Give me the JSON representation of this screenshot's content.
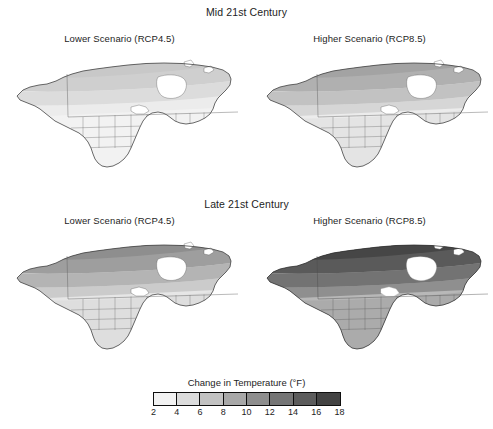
{
  "figure": {
    "sections": [
      {
        "heading": "Mid 21st Century",
        "panels": [
          {
            "title": "Lower Scenario (RCP4.5)",
            "scenario": "RCP4.5",
            "period": "Mid 21st Century"
          },
          {
            "title": "Higher Scenario (RCP8.5)",
            "scenario": "RCP8.5",
            "period": "Mid 21st Century"
          }
        ]
      },
      {
        "heading": "Late 21st Century",
        "panels": [
          {
            "title": "Lower Scenario (RCP4.5)",
            "scenario": "RCP4.5",
            "period": "Late 21st Century"
          },
          {
            "title": "Higher Scenario (RCP8.5)",
            "scenario": "RCP8.5",
            "period": "Late 21st Century"
          }
        ]
      }
    ],
    "legend": {
      "title": "Change in Temperature (°F)",
      "tick_labels": [
        "2",
        "4",
        "6",
        "8",
        "10",
        "12",
        "14",
        "16",
        "18"
      ],
      "swatches": [
        "#f2f2f2",
        "#dcdcdc",
        "#c2c2c2",
        "#a8a8a8",
        "#8e8e8e",
        "#757575",
        "#5c5c5c",
        "#434343"
      ]
    }
  },
  "chart_data": {
    "type": "heatmap",
    "subtitle": "Four-panel map matrix: two time periods × two emissions scenarios",
    "variable": "Change in Temperature",
    "units": "°F",
    "region": "North America (continental, including Alaska, Canada, Mexico, Greenland margin)",
    "colormap": "grayscale, light = small change, dark = large change",
    "legend_position": "bottom center",
    "grid": false,
    "colorbar": {
      "tick_values": [
        2,
        4,
        6,
        8,
        10,
        12,
        14,
        16,
        18
      ],
      "bin_edges": [
        2,
        4,
        6,
        8,
        10,
        12,
        14,
        16,
        18
      ],
      "bin_count": 8,
      "bin_colors": [
        "#f2f2f2",
        "#dcdcdc",
        "#c2c2c2",
        "#a8a8a8",
        "#8e8e8e",
        "#757575",
        "#5c5c5c",
        "#434343"
      ],
      "vmin": 2,
      "vmax": 18
    },
    "panels": [
      {
        "period": "Mid 21st Century",
        "scenario": "RCP4.5",
        "row": 0,
        "col": 0,
        "range_degF": [
          2,
          8
        ],
        "bands": [
          {
            "zone": "Mexico / southern US",
            "value_degF": 3,
            "bin": "2-4"
          },
          {
            "zone": "Contiguous US",
            "value_degF": 4,
            "bin": "4-6"
          },
          {
            "zone": "Southern Canada",
            "value_degF": 5,
            "bin": "4-6"
          },
          {
            "zone": "Northern Canada / Alaska",
            "value_degF": 6,
            "bin": "6-8"
          },
          {
            "zone": "High Arctic",
            "value_degF": 7,
            "bin": "6-8"
          }
        ]
      },
      {
        "period": "Mid 21st Century",
        "scenario": "RCP8.5",
        "row": 0,
        "col": 1,
        "range_degF": [
          3,
          10
        ],
        "bands": [
          {
            "zone": "Mexico / southern US",
            "value_degF": 4,
            "bin": "4-6"
          },
          {
            "zone": "Contiguous US",
            "value_degF": 5,
            "bin": "4-6"
          },
          {
            "zone": "Southern Canada",
            "value_degF": 6,
            "bin": "6-8"
          },
          {
            "zone": "Northern Canada / Alaska",
            "value_degF": 7,
            "bin": "6-8"
          },
          {
            "zone": "High Arctic",
            "value_degF": 9,
            "bin": "8-10"
          }
        ]
      },
      {
        "period": "Late 21st Century",
        "scenario": "RCP4.5",
        "row": 1,
        "col": 0,
        "range_degF": [
          4,
          12
        ],
        "bands": [
          {
            "zone": "Mexico / southern US",
            "value_degF": 5,
            "bin": "4-6"
          },
          {
            "zone": "Contiguous US",
            "value_degF": 6,
            "bin": "6-8"
          },
          {
            "zone": "Southern Canada",
            "value_degF": 8,
            "bin": "8-10"
          },
          {
            "zone": "Northern Canada / Alaska",
            "value_degF": 9,
            "bin": "8-10"
          },
          {
            "zone": "High Arctic",
            "value_degF": 11,
            "bin": "10-12"
          }
        ]
      },
      {
        "period": "Late 21st Century",
        "scenario": "RCP8.5",
        "row": 1,
        "col": 1,
        "range_degF": [
          7,
          18
        ],
        "bands": [
          {
            "zone": "Mexico / southern US",
            "value_degF": 8,
            "bin": "8-10"
          },
          {
            "zone": "Contiguous US",
            "value_degF": 10,
            "bin": "10-12"
          },
          {
            "zone": "Southern Canada",
            "value_degF": 13,
            "bin": "12-14"
          },
          {
            "zone": "Northern Canada / Alaska",
            "value_degF": 15,
            "bin": "14-16"
          },
          {
            "zone": "High Arctic",
            "value_degF": 17,
            "bin": "16-18"
          }
        ]
      }
    ]
  }
}
